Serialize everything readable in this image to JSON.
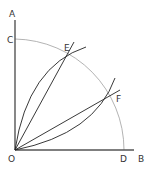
{
  "diagram": {
    "colors": {
      "axis": "#555555",
      "arc": "#aaaaaa",
      "lines": "#222222",
      "text": "#333333"
    },
    "points": {
      "O": {
        "label": "O",
        "x": 15,
        "y": 150
      },
      "A": {
        "label": "A",
        "x": 15,
        "y": 20
      },
      "B": {
        "label": "B",
        "x": 134,
        "y": 150
      },
      "C": {
        "label": "C",
        "x": 15,
        "y": 39
      },
      "D": {
        "label": "D",
        "x": 124,
        "y": 150
      },
      "E": {
        "label": "E",
        "x": 68,
        "y": 52
      },
      "F": {
        "label": "F",
        "x": 110,
        "y": 97
      }
    },
    "labels": {
      "A": "A",
      "B": "B",
      "C": "C",
      "D": "D",
      "E": "E",
      "F": "F",
      "O": "O"
    }
  }
}
